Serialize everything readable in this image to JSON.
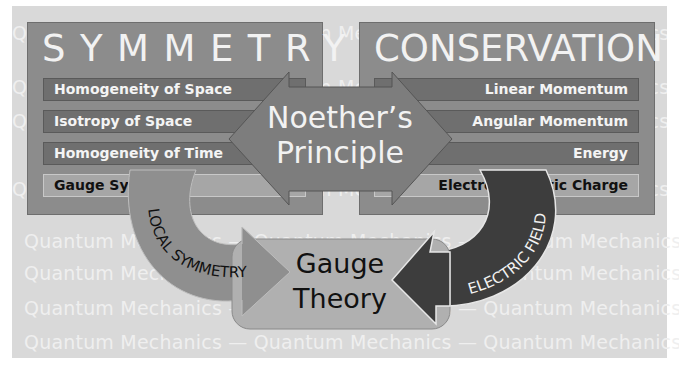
{
  "watermark": {
    "phrase": "Quantum  Mechanics  —  Quantum  Mechanics  —  Quantum  Mechanics",
    "rows": [
      "Quantum  Mechanics  —  Quantum  Mechanics  —  Quantum  Mechanics",
      "Quantum  Mechanics  —  Quantum  Mechanics  —  Quantum  Mechanics",
      "Quantum  Mechanics  —  Quantum  Mechanics  —  Quantum  Mechanics",
      "Quantum  Mechanics  —  Quantum  Mechanics  —  Quantum  Mechanics",
      "Quantum  Mechanics  —  Quantum  Mechanics  —  Quantum  Mechanics",
      "Quantum  Mechanics  —  Quantum  Mechanics  —  Quantum  Mechanics",
      "Quantum  Mechanics  —  Quantum  Mechanics  —  Quantum  Mechanics",
      "Quantum  Mechanics  —  Quantum  Mechanics  —  Quantum  Mechanics"
    ]
  },
  "symmetry": {
    "title": "SYMMETRY",
    "items": [
      {
        "label": "Homogeneity of Space"
      },
      {
        "label": "Isotropy of Space"
      },
      {
        "label": "Homogeneity of Time"
      },
      {
        "label": "Gauge Symmetry"
      }
    ]
  },
  "conservation": {
    "title": "CONSERVATION",
    "items": [
      {
        "label": "Linear Momentum"
      },
      {
        "label": "Angular Momentum"
      },
      {
        "label": "Energy"
      },
      {
        "label": "Electromagnetic Charge"
      }
    ]
  },
  "noether": {
    "line1": "Noether’s",
    "line2": "Principle"
  },
  "gauge_theory": {
    "line1": "Gauge",
    "line2": "Theory"
  },
  "arrows": {
    "local_symmetry": "LOCAL SYMMETRY",
    "electric_field": "ELECTRIC FIELD"
  },
  "colors": {
    "background": "#d9d9d9",
    "box": "#8c8c8c",
    "row_dark": "#6f6f6f",
    "row_light": "#a6a6a6",
    "noether_arrow": "#7d7d7d",
    "gauge_box": "#b0b0b0",
    "local_arrow": "#8f8f8f",
    "electric_arrow": "#3d3d3d"
  }
}
